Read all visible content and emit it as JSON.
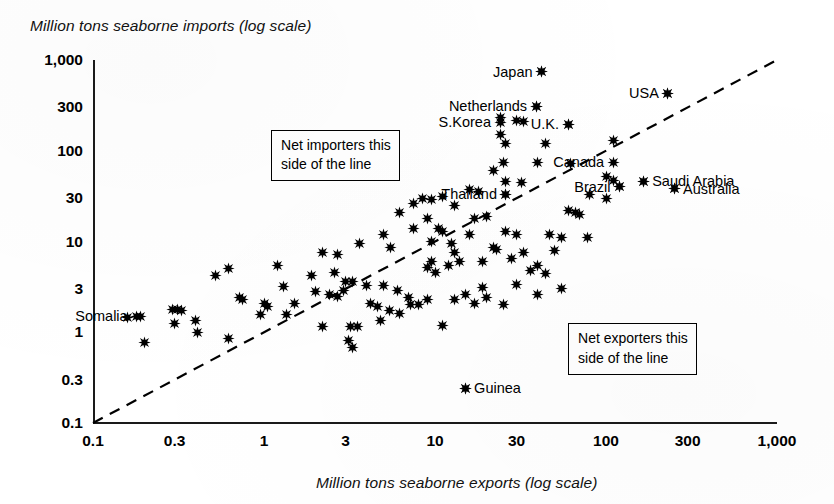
{
  "chart_data": {
    "type": "scatter",
    "title": "",
    "xlabel": "Million tons seaborne exports (log scale)",
    "ylabel": "Million tons seaborne imports (log scale)",
    "xscale": "log",
    "yscale": "log",
    "xlim": [
      0.1,
      1000
    ],
    "ylim": [
      0.1,
      1000
    ],
    "grid": false,
    "legend": null,
    "xticks": [
      "0.1",
      "0.3",
      "1",
      "3",
      "10",
      "30",
      "100",
      "300",
      "1,000"
    ],
    "xtick_values": [
      0.1,
      0.3,
      1,
      3,
      10,
      30,
      100,
      300,
      1000
    ],
    "yticks": [
      "0.1",
      "0.3",
      "1",
      "3",
      "10",
      "30",
      "100",
      "300",
      "1,000"
    ],
    "ytick_values": [
      0.1,
      0.3,
      1,
      3,
      10,
      30,
      100,
      300,
      1000
    ],
    "reference_line": {
      "label": "parity line (imports = exports)",
      "style": "dashed",
      "from": [
        0.1,
        0.1
      ],
      "to": [
        1000,
        1000
      ]
    },
    "annotations": [
      {
        "id": "net-importers",
        "lines": [
          "Net importers this",
          "side of the line"
        ],
        "x": 1.1,
        "y": 170
      },
      {
        "id": "net-exporters",
        "lines": [
          "Net exporters this",
          "side of the line"
        ],
        "x": 60,
        "y": 1.25
      }
    ],
    "labeled_points": [
      {
        "name": "Japan",
        "x": 42,
        "y": 740,
        "label_side": "left"
      },
      {
        "name": "Netherlands",
        "x": 39,
        "y": 310,
        "label_side": "left"
      },
      {
        "name": "USA",
        "x": 230,
        "y": 430,
        "label_side": "left"
      },
      {
        "name": "U.K.",
        "x": 60,
        "y": 195,
        "label_side": "left"
      },
      {
        "name": "S.Korea",
        "x": 24,
        "y": 205,
        "label_side": "left"
      },
      {
        "name": "Canada",
        "x": 110,
        "y": 75,
        "label_side": "left"
      },
      {
        "name": "Saudi Arabia",
        "x": 165,
        "y": 46,
        "label_side": "right"
      },
      {
        "name": "Australia",
        "x": 250,
        "y": 38,
        "label_side": "right"
      },
      {
        "name": "Brazil",
        "x": 120,
        "y": 40,
        "label_side": "left"
      },
      {
        "name": "Thailand",
        "x": 26,
        "y": 33,
        "label_side": "left"
      },
      {
        "name": "Somalia",
        "x": 0.18,
        "y": 1.5,
        "label_side": "left"
      },
      {
        "name": "Guinea",
        "x": 15,
        "y": 0.24,
        "label_side": "right"
      }
    ],
    "points": [
      [
        42,
        740
      ],
      [
        230,
        430
      ],
      [
        39,
        310
      ],
      [
        60,
        195
      ],
      [
        24,
        235
      ],
      [
        30,
        215
      ],
      [
        33,
        210
      ],
      [
        24,
        150
      ],
      [
        26,
        120
      ],
      [
        44,
        120
      ],
      [
        110,
        130
      ],
      [
        25,
        75
      ],
      [
        40,
        75
      ],
      [
        62,
        72
      ],
      [
        22,
        60
      ],
      [
        26,
        46
      ],
      [
        32,
        45
      ],
      [
        100,
        52
      ],
      [
        110,
        47
      ],
      [
        165,
        46
      ],
      [
        250,
        38
      ],
      [
        120,
        40
      ],
      [
        80,
        33
      ],
      [
        100,
        30
      ],
      [
        26,
        33
      ],
      [
        16,
        37
      ],
      [
        18,
        36
      ],
      [
        11,
        31
      ],
      [
        8.5,
        30
      ],
      [
        9.5,
        29
      ],
      [
        7.5,
        26
      ],
      [
        13,
        25
      ],
      [
        6.2,
        21
      ],
      [
        9,
        18
      ],
      [
        20,
        19
      ],
      [
        17,
        18
      ],
      [
        7.5,
        14
      ],
      [
        10.5,
        14
      ],
      [
        11,
        13
      ],
      [
        16,
        12
      ],
      [
        26,
        13
      ],
      [
        30,
        12
      ],
      [
        60,
        22
      ],
      [
        66,
        21
      ],
      [
        70,
        20
      ],
      [
        55,
        11
      ],
      [
        78,
        11
      ],
      [
        47,
        12
      ],
      [
        5,
        12
      ],
      [
        9.5,
        10
      ],
      [
        12.5,
        9.5
      ],
      [
        3.6,
        9.5
      ],
      [
        5.5,
        8.5
      ],
      [
        13,
        7.5
      ],
      [
        14,
        6
      ],
      [
        19,
        6
      ],
      [
        28,
        6.5
      ],
      [
        40,
        5.5
      ],
      [
        9.5,
        6
      ],
      [
        12,
        5.5
      ],
      [
        9,
        5.2
      ],
      [
        10,
        4.6
      ],
      [
        2.2,
        7.5
      ],
      [
        2.7,
        7.2
      ],
      [
        1.2,
        5.5
      ],
      [
        1.9,
        4.2
      ],
      [
        2.6,
        4.6
      ],
      [
        1.3,
        3.2
      ],
      [
        3.0,
        3.6
      ],
      [
        3.3,
        3.6
      ],
      [
        1.0,
        2.1
      ],
      [
        1.5,
        2.1
      ],
      [
        2.4,
        2.6
      ],
      [
        2.7,
        2.5
      ],
      [
        0.62,
        5.1
      ],
      [
        0.52,
        4.2
      ],
      [
        0.72,
        2.4
      ],
      [
        0.75,
        2.3
      ],
      [
        1.05,
        1.9
      ],
      [
        4.2,
        2.1
      ],
      [
        4.8,
        1.35
      ],
      [
        4.6,
        1.9
      ],
      [
        5.4,
        1.75
      ],
      [
        3.5,
        1.15
      ],
      [
        2.2,
        1.15
      ],
      [
        3.2,
        1.15
      ],
      [
        0.16,
        1.45
      ],
      [
        0.19,
        1.5
      ],
      [
        0.2,
        0.78
      ],
      [
        0.29,
        1.8
      ],
      [
        0.31,
        1.8
      ],
      [
        0.33,
        1.75
      ],
      [
        0.3,
        1.25
      ],
      [
        0.4,
        1.35
      ],
      [
        0.41,
        1.0
      ],
      [
        0.62,
        0.85
      ],
      [
        3.1,
        0.82
      ],
      [
        3.3,
        0.68
      ],
      [
        0.96,
        1.55
      ],
      [
        1.35,
        1.55
      ],
      [
        6.2,
        1.6
      ],
      [
        8.0,
        2.0
      ],
      [
        15,
        0.24
      ],
      [
        2.0,
        2.8
      ],
      [
        4.0,
        3.3
      ],
      [
        5.0,
        3.3
      ],
      [
        6.0,
        2.9
      ],
      [
        7.0,
        2.4
      ],
      [
        2.9,
        2.9
      ],
      [
        15,
        2.6
      ],
      [
        11,
        1.2
      ],
      [
        20,
        2.4
      ],
      [
        25,
        2.0
      ],
      [
        9.0,
        2.3
      ],
      [
        7.2,
        2.0
      ],
      [
        36,
        4.8
      ],
      [
        44,
        4.4
      ],
      [
        30,
        3.4
      ],
      [
        19,
        3.1
      ],
      [
        22,
        8.5
      ],
      [
        23,
        8.2
      ],
      [
        50,
        8.0
      ],
      [
        33,
        7.6
      ],
      [
        40,
        2.6
      ],
      [
        55,
        3.0
      ],
      [
        17,
        2.1
      ],
      [
        13,
        2.3
      ]
    ]
  }
}
